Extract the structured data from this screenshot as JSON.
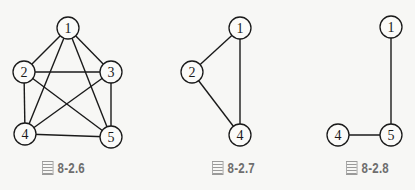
{
  "figures": [
    {
      "id": "fig-8-2-6",
      "caption_prefix": "圖",
      "caption_number": "8-2.6",
      "nodes": [
        {
          "label": "1",
          "x": 68,
          "y": 28
        },
        {
          "label": "2",
          "x": 24,
          "y": 72
        },
        {
          "label": "3",
          "x": 111,
          "y": 72
        },
        {
          "label": "4",
          "x": 25,
          "y": 134
        },
        {
          "label": "5",
          "x": 111,
          "y": 137
        }
      ],
      "edges": [
        [
          "1",
          "2"
        ],
        [
          "1",
          "3"
        ],
        [
          "1",
          "4"
        ],
        [
          "1",
          "5"
        ],
        [
          "2",
          "3"
        ],
        [
          "2",
          "4"
        ],
        [
          "2",
          "5"
        ],
        [
          "3",
          "4"
        ],
        [
          "3",
          "5"
        ],
        [
          "4",
          "5"
        ]
      ]
    },
    {
      "id": "fig-8-2-7",
      "caption_prefix": "圖",
      "caption_number": "8-2.7",
      "nodes": [
        {
          "label": "1",
          "x": 240,
          "y": 28
        },
        {
          "label": "2",
          "x": 192,
          "y": 72
        },
        {
          "label": "4",
          "x": 240,
          "y": 135
        }
      ],
      "edges": [
        [
          "1",
          "2"
        ],
        [
          "1",
          "4"
        ],
        [
          "2",
          "4"
        ]
      ]
    },
    {
      "id": "fig-8-2-8",
      "caption_prefix": "圖",
      "caption_number": "8-2.8",
      "nodes": [
        {
          "label": "1",
          "x": 391,
          "y": 27
        },
        {
          "label": "4",
          "x": 338,
          "y": 135
        },
        {
          "label": "5",
          "x": 391,
          "y": 135
        }
      ],
      "edges": [
        [
          "1",
          "5"
        ],
        [
          "4",
          "5"
        ]
      ]
    }
  ],
  "style": {
    "node_radius": 11,
    "line_color": "#1a1a1a",
    "caption_color": "#6e6e6e",
    "background": "#f7f7f5"
  }
}
